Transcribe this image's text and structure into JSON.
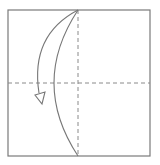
{
  "diagram": {
    "type": "origami-fold-step",
    "paper": {
      "shape": "square",
      "x": 8,
      "y": 10,
      "width": 142,
      "height": 146,
      "stroke": "#7a7a7a"
    },
    "valley_folds": [
      {
        "name": "vertical-center-line",
        "x1": 78,
        "y1": 10,
        "x2": 78,
        "y2": 156
      },
      {
        "name": "horizontal-center-line",
        "x1": 8,
        "y1": 83,
        "x2": 150,
        "y2": 83
      }
    ],
    "curved_crease": {
      "from": [
        78,
        10
      ],
      "control": [
        30,
        83
      ],
      "to": [
        78,
        156
      ]
    },
    "fold_arrow": {
      "from": [
        78,
        10
      ],
      "control": [
        20,
        40
      ],
      "to": [
        40,
        97
      ],
      "direction": "down-left"
    }
  }
}
